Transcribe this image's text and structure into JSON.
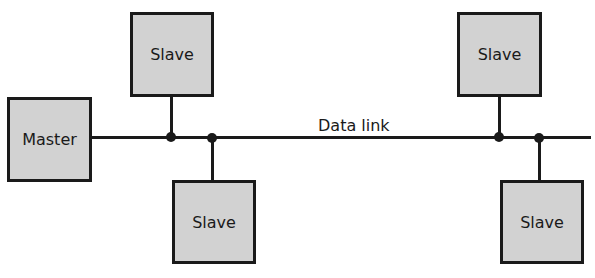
{
  "diagram": {
    "type": "bus-topology",
    "master": {
      "label": "Master"
    },
    "bus": {
      "label": "Data link"
    },
    "slaves": [
      {
        "label": "Slave",
        "position": "top-left"
      },
      {
        "label": "Slave",
        "position": "bottom-left"
      },
      {
        "label": "Slave",
        "position": "top-right"
      },
      {
        "label": "Slave",
        "position": "bottom-right"
      }
    ],
    "colors": {
      "box_fill": "#d2d2d2",
      "stroke": "#1a1a1a",
      "background": "#ffffff"
    }
  }
}
